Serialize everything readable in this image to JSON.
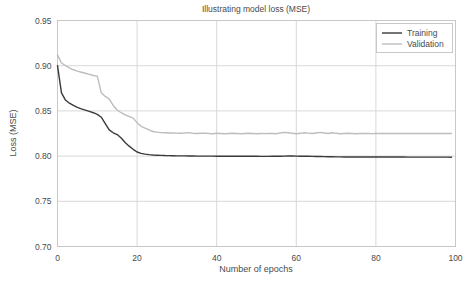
{
  "chart_data": {
    "type": "line",
    "title": "Illustrating model loss (MSE)",
    "xlabel": "Number of epochs",
    "ylabel": "Loss (MSE)",
    "xlim": [
      0,
      100
    ],
    "ylim": [
      0.7,
      0.95
    ],
    "xticks": [
      0,
      20,
      40,
      60,
      80,
      100
    ],
    "xtick_labels": [
      "0",
      "20",
      "40",
      "60",
      "80",
      "100"
    ],
    "yticks": [
      0.7,
      0.75,
      0.8,
      0.85,
      0.9,
      0.95
    ],
    "ytick_labels": [
      "0.70",
      "0.75",
      "0.80",
      "0.85",
      "0.90",
      "0.95"
    ],
    "grid": true,
    "legend_position": "upper right",
    "legend_entries": [
      "Training",
      "Validation"
    ],
    "colors": {
      "training": "#3a3a3a",
      "validation": "#bdbdbd",
      "grid": "#d8d8d8",
      "axis": "#c8c8c8",
      "text": "#4a4a4a",
      "background": "#ffffff"
    },
    "x": [
      0,
      1,
      2,
      3,
      4,
      5,
      6,
      7,
      8,
      9,
      10,
      11,
      12,
      13,
      14,
      15,
      16,
      17,
      18,
      19,
      20,
      21,
      22,
      23,
      24,
      25,
      26,
      27,
      28,
      29,
      30,
      31,
      32,
      33,
      34,
      35,
      36,
      37,
      38,
      39,
      40,
      41,
      42,
      43,
      44,
      45,
      46,
      47,
      48,
      49,
      50,
      51,
      52,
      53,
      54,
      55,
      56,
      57,
      58,
      59,
      60,
      61,
      62,
      63,
      64,
      65,
      66,
      67,
      68,
      69,
      70,
      71,
      72,
      73,
      74,
      75,
      76,
      77,
      78,
      79,
      80,
      81,
      82,
      83,
      84,
      85,
      86,
      87,
      88,
      89,
      90,
      91,
      92,
      93,
      94,
      95,
      96,
      97,
      98,
      99
    ],
    "series": [
      {
        "name": "Training",
        "color": "#3a3a3a",
        "values": [
          0.9,
          0.87,
          0.862,
          0.8585,
          0.856,
          0.854,
          0.8522,
          0.8508,
          0.8494,
          0.848,
          0.8462,
          0.843,
          0.836,
          0.829,
          0.8258,
          0.8238,
          0.82,
          0.815,
          0.811,
          0.8075,
          0.8045,
          0.803,
          0.8022,
          0.8016,
          0.8012,
          0.801,
          0.8008,
          0.8006,
          0.8005,
          0.8004,
          0.8003,
          0.8002,
          0.8002,
          0.8001,
          0.8001,
          0.8,
          0.8,
          0.8,
          0.8,
          0.8,
          0.7999,
          0.7999,
          0.7998,
          0.7998,
          0.7998,
          0.7998,
          0.7998,
          0.7998,
          0.7998,
          0.7998,
          0.7998,
          0.7997,
          0.7997,
          0.7997,
          0.7998,
          0.7998,
          0.7999,
          0.8,
          0.8001,
          0.8001,
          0.8,
          0.7999,
          0.7999,
          0.7998,
          0.7997,
          0.7996,
          0.7995,
          0.7994,
          0.7993,
          0.7992,
          0.7991,
          0.7991,
          0.799,
          0.799,
          0.799,
          0.799,
          0.799,
          0.799,
          0.799,
          0.799,
          0.799,
          0.799,
          0.799,
          0.799,
          0.799,
          0.799,
          0.799,
          0.799,
          0.7989,
          0.7989,
          0.7989,
          0.7989,
          0.7989,
          0.7989,
          0.7989,
          0.7989,
          0.7989,
          0.7989,
          0.7989,
          0.7988
        ]
      },
      {
        "name": "Validation",
        "color": "#bdbdbd",
        "values": [
          0.912,
          0.903,
          0.9,
          0.8975,
          0.8955,
          0.894,
          0.8928,
          0.8916,
          0.8904,
          0.8892,
          0.8885,
          0.87,
          0.866,
          0.863,
          0.856,
          0.851,
          0.848,
          0.8455,
          0.844,
          0.842,
          0.837,
          0.833,
          0.831,
          0.829,
          0.8272,
          0.8265,
          0.826,
          0.8258,
          0.8256,
          0.8255,
          0.8254,
          0.8253,
          0.8256,
          0.826,
          0.8253,
          0.825,
          0.8252,
          0.8254,
          0.825,
          0.8248,
          0.8252,
          0.825,
          0.8248,
          0.825,
          0.8252,
          0.825,
          0.8248,
          0.825,
          0.8252,
          0.825,
          0.8248,
          0.825,
          0.8249,
          0.8251,
          0.825,
          0.8248,
          0.8255,
          0.8262,
          0.8258,
          0.8252,
          0.8248,
          0.8252,
          0.8258,
          0.8254,
          0.825,
          0.8256,
          0.8262,
          0.8256,
          0.825,
          0.8258,
          0.8252,
          0.8248,
          0.825,
          0.8252,
          0.825,
          0.8248,
          0.825,
          0.8251,
          0.825,
          0.8249,
          0.825,
          0.825,
          0.825,
          0.825,
          0.825,
          0.825,
          0.825,
          0.825,
          0.825,
          0.825,
          0.825,
          0.825,
          0.825,
          0.825,
          0.825,
          0.825,
          0.825,
          0.825,
          0.825,
          0.825
        ]
      }
    ]
  }
}
